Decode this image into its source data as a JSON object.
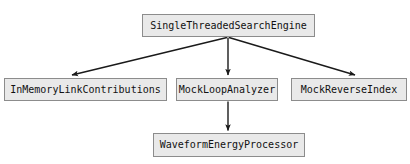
{
  "diagram": {
    "type": "class-dependency-graph",
    "background_color": "#ffffff",
    "node_fill_color": "#e9e9e9",
    "node_border_color": "#8c8c8c",
    "edge_color": "#1a1a1a",
    "text_color": "#111111",
    "nodes": [
      {
        "id": "root",
        "label": "SingleThreadedSearchEngine"
      },
      {
        "id": "left",
        "label": "InMemoryLinkContributions"
      },
      {
        "id": "middle",
        "label": "MockLoopAnalyzer"
      },
      {
        "id": "right",
        "label": "MockReverseIndex"
      },
      {
        "id": "bottom",
        "label": "WaveformEnergyProcessor"
      }
    ],
    "edges": [
      {
        "from": "SingleThreadedSearchEngine",
        "to": "InMemoryLinkContributions",
        "style": "solid-arrow"
      },
      {
        "from": "SingleThreadedSearchEngine",
        "to": "MockLoopAnalyzer",
        "style": "solid-arrow"
      },
      {
        "from": "SingleThreadedSearchEngine",
        "to": "MockReverseIndex",
        "style": "solid-arrow"
      },
      {
        "from": "MockLoopAnalyzer",
        "to": "WaveformEnergyProcessor",
        "style": "solid-arrow"
      }
    ]
  }
}
